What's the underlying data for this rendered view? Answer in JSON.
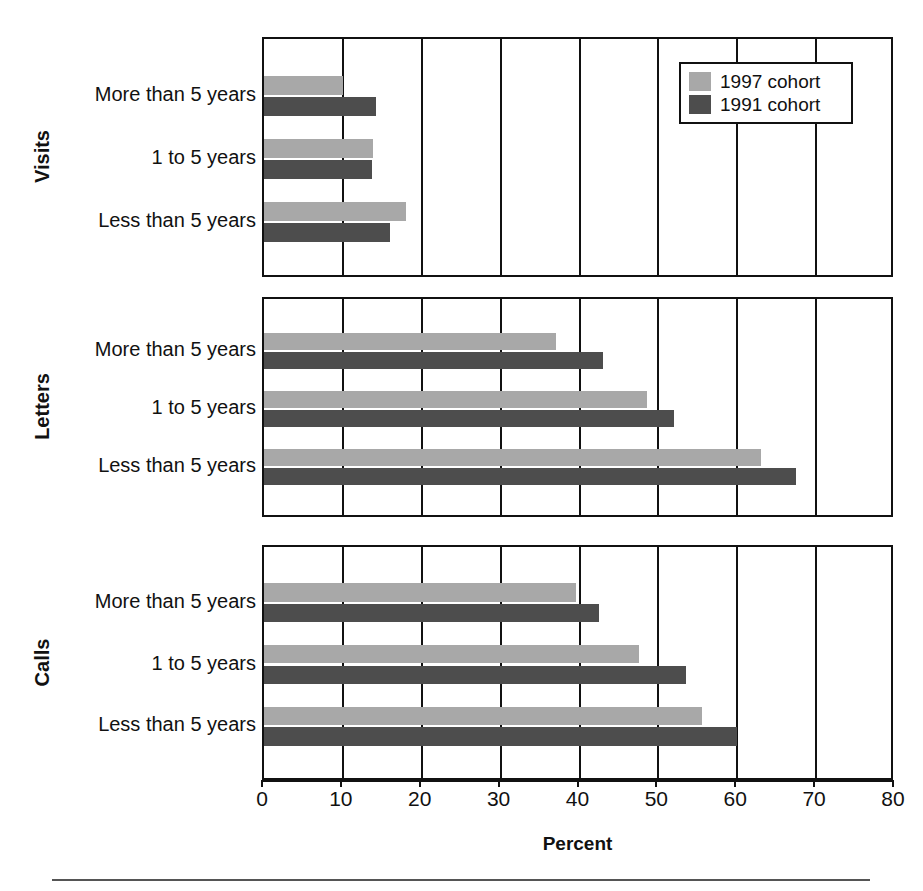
{
  "chart_data": {
    "type": "bar",
    "orientation": "horizontal",
    "title": "",
    "xlabel": "Percent",
    "ylabel": "",
    "xlim": [
      0,
      80
    ],
    "xticks": [
      0,
      10,
      20,
      30,
      40,
      50,
      60,
      70,
      80
    ],
    "xtick_labels": [
      "0",
      "10",
      "20",
      "30",
      "40",
      "50",
      "60",
      "70",
      "80"
    ],
    "grid": true,
    "grid_axis": "x",
    "legend_position": "top-right",
    "categories": [
      "Less than 5 years",
      "1 to 5 years",
      "More than 5 years"
    ],
    "series": [
      {
        "name": "1997 cohort",
        "color": "#a8a8a8"
      },
      {
        "name": "1991 cohort",
        "color": "#4d4d4d"
      }
    ],
    "panels": [
      {
        "name": "Visits",
        "rows": [
          {
            "category": "More than 5 years",
            "values": {
              "1997 cohort": 10.0,
              "1991 cohort": 14.2
            }
          },
          {
            "category": "1 to 5 years",
            "values": {
              "1997 cohort": 13.8,
              "1991 cohort": 13.7
            }
          },
          {
            "category": "Less than 5 years",
            "values": {
              "1997 cohort": 18.0,
              "1991 cohort": 16.0
            }
          }
        ]
      },
      {
        "name": "Letters",
        "rows": [
          {
            "category": "More than 5 years",
            "values": {
              "1997 cohort": 37.0,
              "1991 cohort": 43.0
            }
          },
          {
            "category": "1 to 5 years",
            "values": {
              "1997 cohort": 48.5,
              "1991 cohort": 52.0
            }
          },
          {
            "category": "Less than 5 years",
            "values": {
              "1997 cohort": 63.0,
              "1991 cohort": 67.5
            }
          }
        ]
      },
      {
        "name": "Calls",
        "rows": [
          {
            "category": "More than 5 years",
            "values": {
              "1997 cohort": 39.5,
              "1991 cohort": 42.5
            }
          },
          {
            "category": "1 to 5 years",
            "values": {
              "1997 cohort": 47.5,
              "1991 cohort": 53.5
            }
          },
          {
            "category": "Less than 5 years",
            "values": {
              "1997 cohort": 55.5,
              "1991 cohort": 60.0
            }
          }
        ]
      }
    ]
  },
  "axis": {
    "xlabel": "Percent",
    "ticks": [
      "0",
      "10",
      "20",
      "30",
      "40",
      "50",
      "60",
      "70",
      "80"
    ]
  },
  "legend": {
    "entries": [
      {
        "label": "1997 cohort",
        "swatch": "light-gray-swatch"
      },
      {
        "label": "1991 cohort",
        "swatch": "dark-gray-swatch"
      }
    ]
  },
  "panels": {
    "visits": {
      "title": "Visits",
      "categories": [
        "More than 5 years",
        "1 to 5 years",
        "Less than 5 years"
      ]
    },
    "letters": {
      "title": "Letters",
      "categories": [
        "More than 5 years",
        "1 to 5 years",
        "Less than 5 years"
      ]
    },
    "calls": {
      "title": "Calls",
      "categories": [
        "More than 5 years",
        "1 to 5 years",
        "Less than 5 years"
      ]
    }
  }
}
